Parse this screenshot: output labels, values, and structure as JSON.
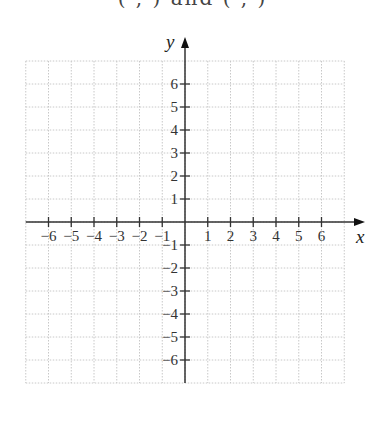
{
  "header": {
    "cutoff_text": "(  ,   ) and (  ,   )"
  },
  "chart_data": {
    "type": "scatter",
    "title": "",
    "xlabel": "x",
    "ylabel": "y",
    "xlim": [
      -7,
      7
    ],
    "ylim": [
      -7,
      7
    ],
    "grid": true,
    "grid_style": "dotted",
    "x_ticks": [
      -6,
      -5,
      -4,
      -3,
      -2,
      -1,
      1,
      2,
      3,
      4,
      5,
      6
    ],
    "y_ticks": [
      -6,
      -5,
      -4,
      -3,
      -2,
      -1,
      1,
      2,
      3,
      4,
      5,
      6
    ],
    "x_tick_labels": [
      "−6",
      "−5",
      "−4",
      "−3",
      "−2",
      "−1",
      "1",
      "2",
      "3",
      "4",
      "5",
      "6"
    ],
    "y_tick_labels": [
      "−6",
      "−5",
      "−4",
      "−3",
      "−2",
      "−1",
      "1",
      "2",
      "3",
      "4",
      "5",
      "6"
    ],
    "series": [],
    "legend": null
  },
  "colors": {
    "axis": "#333333",
    "grid": "#c8c8c8",
    "background": "#ffffff"
  }
}
